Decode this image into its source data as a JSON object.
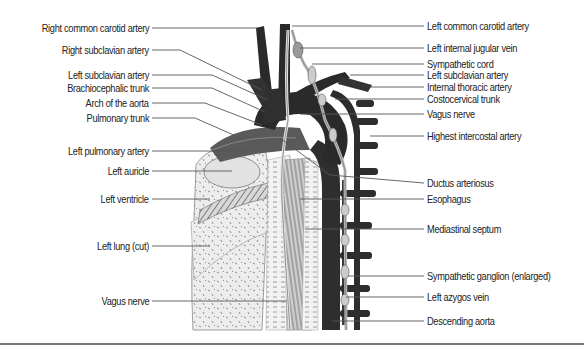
{
  "figure": {
    "left_labels": [
      {
        "text": "Right common carotid artery",
        "y": 28
      },
      {
        "text": "Right subclavian artery",
        "y": 50
      },
      {
        "text": "Left subclavian artery",
        "y": 75
      },
      {
        "text": "Brachiocephalic trunk",
        "y": 88
      },
      {
        "text": "Arch of the aorta",
        "y": 103
      },
      {
        "text": "Pulmonary trunk",
        "y": 118
      },
      {
        "text": "Left pulmonary artery",
        "y": 151
      },
      {
        "text": "Left auricle",
        "y": 171
      },
      {
        "text": "Left ventricle",
        "y": 199
      },
      {
        "text": "Left lung (cut)",
        "y": 246
      },
      {
        "text": "Vagus nerve",
        "y": 301
      }
    ],
    "right_labels": [
      {
        "text": "Left common carotid artery",
        "y": 26
      },
      {
        "text": "Left internal jugular vein",
        "y": 48
      },
      {
        "text": "Sympathetic cord",
        "y": 64
      },
      {
        "text": "Left subclavian artery",
        "y": 75
      },
      {
        "text": "Internal thoracic artery",
        "y": 87
      },
      {
        "text": "Costocervical trunk",
        "y": 99
      },
      {
        "text": "Vagus nerve",
        "y": 114
      },
      {
        "text": "Highest intercostal artery",
        "y": 136
      },
      {
        "text": "Ductus arteriosus",
        "y": 183
      },
      {
        "text": "Esophagus",
        "y": 199
      },
      {
        "text": "Mediastinal septum",
        "y": 229
      },
      {
        "text": "Sympathetic ganglion (enlarged)",
        "y": 276
      },
      {
        "text": "Left azygos vein",
        "y": 297
      },
      {
        "text": "Descending aorta",
        "y": 321
      }
    ],
    "colors": {
      "vessel_dark": "#2b2b2b",
      "vessel_mid": "#4a4a4a",
      "tissue_light": "#e8e8e8",
      "leader_line": "#555555",
      "divider": "#777777"
    }
  }
}
